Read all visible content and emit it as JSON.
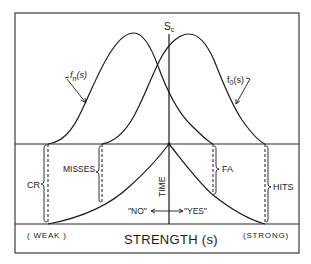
{
  "diagram": {
    "type": "signal-detection-theory",
    "threshold_label": "S",
    "threshold_subscript": "c",
    "noise_curve": {
      "label_f": "f",
      "label_sub": "n",
      "label_arg": "(s)"
    },
    "signal_curve": {
      "label_f": "f",
      "label_sub": "0",
      "label_arg": "(s)"
    },
    "regions": {
      "correct_rejection": "CR",
      "misses": "MISSES",
      "false_alarms": "FA",
      "hits": "HITS"
    },
    "time_axis_label": "TIME",
    "response_no": "\"NO\"",
    "response_yes": "\"YES\"",
    "x_axis": {
      "title": "STRENGTH (s)",
      "left_end": "( WEAK )",
      "right_end": "(STRONG)"
    }
  }
}
